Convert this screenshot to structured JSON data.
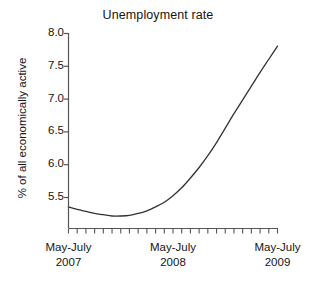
{
  "chart_data": {
    "type": "line",
    "title": "Unemployment rate",
    "xlabel": "",
    "ylabel": "% of all economically active",
    "ylim": [
      5.1,
      8.0
    ],
    "yticks": [
      "8.0",
      "7.5",
      "7.0",
      "6.5",
      "6.0",
      "5.5"
    ],
    "ytick_values": [
      8.0,
      7.5,
      7.0,
      6.5,
      6.0,
      5.5
    ],
    "xtick_labels": [
      {
        "line1": "May-July",
        "line2": "2007"
      },
      {
        "line1": "May-July",
        "line2": "2008"
      },
      {
        "line1": "May-July",
        "line2": "2009"
      }
    ],
    "x_minor_tick_count": 25,
    "grid": false,
    "legend": null,
    "line_color": "#333333",
    "axis_color": "#555555",
    "series": [
      {
        "name": "Unemployment rate",
        "x": [
          "May-Jul 2007",
          "Jun-Aug 2007",
          "Jul-Sep 2007",
          "Aug-Oct 2007",
          "Sep-Nov 2007",
          "Oct-Dec 2007",
          "Nov-Jan 2008",
          "Dec-Feb 2008",
          "Jan-Mar 2008",
          "Feb-Apr 2008",
          "Mar-May 2008",
          "Apr-Jun 2008",
          "May-Jul 2008",
          "Jun-Aug 2008",
          "Jul-Sep 2008",
          "Aug-Oct 2008",
          "Sep-Nov 2008",
          "Oct-Dec 2008",
          "Nov-Jan 2009",
          "Dec-Feb 2009",
          "Jan-Mar 2009",
          "Feb-Apr 2009",
          "Mar-May 2009",
          "Apr-Jun 2009",
          "May-Jul 2009"
        ],
        "values": [
          5.35,
          5.31,
          5.28,
          5.25,
          5.23,
          5.21,
          5.21,
          5.22,
          5.25,
          5.29,
          5.35,
          5.42,
          5.52,
          5.64,
          5.79,
          5.95,
          6.13,
          6.33,
          6.55,
          6.77,
          6.98,
          7.19,
          7.4,
          7.6,
          7.8
        ]
      }
    ],
    "annotations": []
  }
}
